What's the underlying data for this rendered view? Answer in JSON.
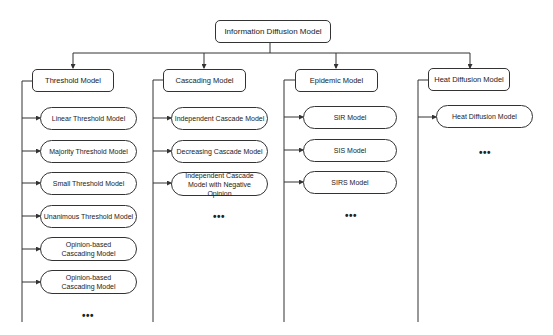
{
  "root": {
    "label": "Information Diffusion Model"
  },
  "categories": [
    {
      "label": "Threshold Model",
      "children": [
        "Linear Threshold Model",
        "Majority Threshold Model",
        "Small Threshold Model",
        "Unanimous Threshold Model",
        "Opinion-based Cascading Model",
        "Opinion-based Cascading Model"
      ],
      "more": "•••"
    },
    {
      "label": "Cascading Model",
      "children": [
        "Independent Cascade Model",
        "Decreasing Cascade Model",
        "Independent Cascade Model with Negative Opinion"
      ],
      "more": "•••"
    },
    {
      "label": "Epidemic Model",
      "children": [
        "SIR Model",
        "SIS Model",
        "SIRS Model"
      ],
      "more": "•••"
    },
    {
      "label": "Heat Diffusion Model",
      "children": [
        "Heat Diffusion Model"
      ],
      "more": "•••"
    }
  ],
  "colors": {
    "line": "#333333",
    "background": "#ffffff"
  }
}
